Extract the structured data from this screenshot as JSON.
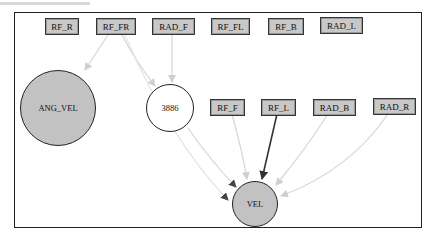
{
  "diagram": {
    "type": "directed-graph",
    "colors": {
      "box_fill": "#c8c8c8",
      "latent_fill": "#c2c2c2",
      "highlight_node_fill": "#ffffff",
      "strong_edge": "#333333",
      "weak_edge": "#d4d4d4"
    },
    "nodes": {
      "rf_r": "RF_R",
      "rf_fr": "RF_FR",
      "rad_f": "RAD_F",
      "rf_fl": "RF_FL",
      "rf_b": "RF_B",
      "rad_l": "RAD_L",
      "ang_vel": "ANG_VEL",
      "n3886": "3886",
      "rf_f": "RF_F",
      "rf_l": "RF_L",
      "rad_b": "RAD_B",
      "rad_r": "RAD_R",
      "vel": "VEL"
    },
    "edges": [
      {
        "from": "RF_FR",
        "to": "ANG_VEL",
        "style": "weak"
      },
      {
        "from": "RF_FR",
        "to": "3886",
        "style": "weak"
      },
      {
        "from": "RAD_F",
        "to": "3886",
        "style": "weak"
      },
      {
        "from": "3886",
        "to": "VEL",
        "style": "weak"
      },
      {
        "from": "RF_F",
        "to": "VEL",
        "style": "weak"
      },
      {
        "from": "RF_L",
        "to": "VEL",
        "style": "strong"
      },
      {
        "from": "RAD_B",
        "to": "VEL",
        "style": "weak"
      },
      {
        "from": "RAD_R",
        "to": "VEL",
        "style": "weak"
      },
      {
        "from": "RF_FR",
        "to": "VEL",
        "style": "weak"
      }
    ]
  }
}
